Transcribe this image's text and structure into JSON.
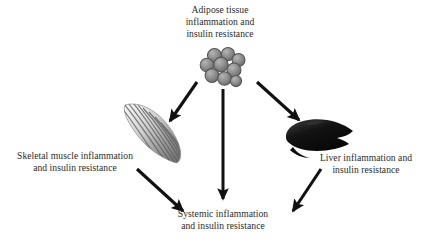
{
  "diagram": {
    "type": "radial-flow",
    "nodes": [
      {
        "id": "adipose",
        "icon": "adipocyte-cluster-icon",
        "lines": [
          "Adipose tissue",
          "inflammation and",
          "insulin resistance"
        ]
      },
      {
        "id": "muscle",
        "icon": "skeletal-muscle-icon",
        "lines": [
          "Skeletal muscle inflammation",
          "and insulin resistance"
        ]
      },
      {
        "id": "liver",
        "icon": "liver-icon",
        "lines": [
          "Liver inflammation and",
          "insulin resistance"
        ]
      },
      {
        "id": "systemic",
        "icon": "none",
        "lines": [
          "Systemic inflammation",
          "and insulin resistance"
        ]
      }
    ],
    "edges": [
      {
        "id": "adipose-to-muscle",
        "from": "adipose",
        "to": "muscle",
        "style": "solid-arrow"
      },
      {
        "id": "adipose-to-liver",
        "from": "adipose",
        "to": "liver",
        "style": "solid-arrow"
      },
      {
        "id": "adipose-to-systemic",
        "from": "adipose",
        "to": "systemic",
        "style": "solid-arrow"
      },
      {
        "id": "muscle-to-systemic",
        "from": "muscle",
        "to": "systemic",
        "style": "solid-arrow"
      },
      {
        "id": "liver-to-systemic",
        "from": "liver",
        "to": "systemic",
        "style": "solid-arrow"
      }
    ],
    "colors": {
      "background": "#ffffff",
      "text": "#2b2b2b",
      "arrow": "#111111",
      "adipocyte": "#8a8a8a",
      "adipocyte_outline": "#5a5a5a",
      "muscle_light": "#f2f2f2",
      "muscle_dark": "#6f6f6f",
      "liver": "#0d0d0d"
    }
  }
}
